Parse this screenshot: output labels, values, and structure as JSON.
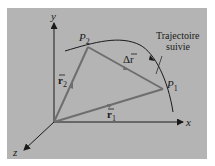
{
  "figure": {
    "background": "#b4b4b4",
    "axis_color": "#1a1a1a",
    "vector_color": "#6e6e6e",
    "axes": {
      "x": "x",
      "y": "y",
      "z": "z"
    },
    "points": {
      "p1": "P",
      "p1_sub": "1",
      "p2": "P",
      "p2_sub": "2"
    },
    "vectors": {
      "r1": "r",
      "r1_sub": "1",
      "r2": "r",
      "r2_sub": "2",
      "delta_r": "Δr"
    },
    "trajectory_label": [
      "Trajectoire",
      "suivie"
    ]
  }
}
